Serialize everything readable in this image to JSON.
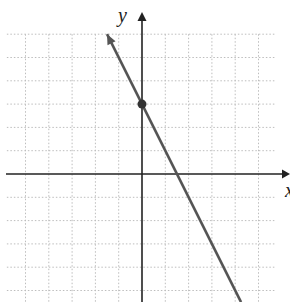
{
  "chart_data": {
    "type": "line",
    "title": "",
    "xlabel": "x",
    "ylabel": "y",
    "xlim": [
      -6,
      6
    ],
    "ylim": [
      -5.5,
      6
    ],
    "grid": true,
    "grid_style": "dotted",
    "series": [
      {
        "name": "line",
        "equation": "y = -2x + 3",
        "slope": -2,
        "y_intercept": 3,
        "x_intercept": 1.5,
        "points": [
          [
            -1.5,
            6
          ],
          [
            0,
            3
          ],
          [
            1.5,
            0
          ],
          [
            4.25,
            -5.5
          ]
        ],
        "arrow_start": true,
        "color": "#555555"
      }
    ],
    "highlighted_points": [
      {
        "label": "y-intercept",
        "x": 0,
        "y": 3
      }
    ]
  },
  "labels": {
    "x_axis": "x",
    "y_axis": "y"
  },
  "colors": {
    "axis": "#222222",
    "line": "#555555",
    "point": "#333333",
    "grid": "#bdbdbd"
  }
}
